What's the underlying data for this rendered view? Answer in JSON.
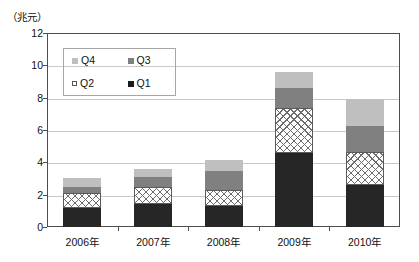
{
  "unit_caption": "（兆元）",
  "legend": {
    "items": [
      {
        "key": "Q4",
        "label": "Q4",
        "swatch": "light-gray-square",
        "color": "#bfbfbf"
      },
      {
        "key": "Q3",
        "label": "Q3",
        "swatch": "medium-gray-square",
        "color": "#808080"
      },
      {
        "key": "Q2",
        "label": "Q2",
        "swatch": "white-hollow-square",
        "color": "#ffffff"
      },
      {
        "key": "Q1",
        "label": "Q1",
        "swatch": "black-square",
        "color": "#1a1a1a"
      }
    ]
  },
  "chart_data": {
    "type": "bar",
    "stacked": true,
    "title": "",
    "xlabel": "",
    "ylabel": "",
    "unit": "兆元",
    "categories": [
      "2006年",
      "2007年",
      "2008年",
      "2009年",
      "2010年"
    ],
    "series": [
      {
        "name": "Q1",
        "color": "#262626",
        "values": [
          1.2,
          1.4,
          1.3,
          4.6,
          2.6
        ]
      },
      {
        "name": "Q2",
        "color": "#ffffff",
        "pattern": "checkered",
        "values": [
          0.9,
          1.05,
          1.0,
          2.75,
          2.05
        ]
      },
      {
        "name": "Q3",
        "color": "#808080",
        "values": [
          0.4,
          0.65,
          1.15,
          1.25,
          1.6
        ]
      },
      {
        "name": "Q4",
        "color": "#bfbfbf",
        "values": [
          0.55,
          0.5,
          0.7,
          1.0,
          1.7
        ]
      }
    ],
    "totals": [
      3.05,
      3.6,
      4.15,
      9.6,
      7.95
    ],
    "ylim": [
      0,
      12
    ],
    "yticks": [
      0,
      2,
      4,
      6,
      8,
      10,
      12
    ],
    "ytick_labels": [
      "0",
      "2",
      "4",
      "6",
      "8",
      "10",
      "12"
    ],
    "grid": true,
    "legend_position": "upper-left-inside"
  }
}
